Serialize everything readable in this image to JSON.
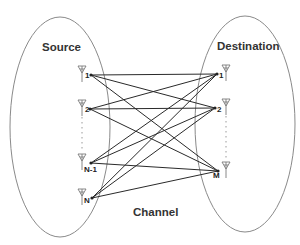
{
  "diagram": {
    "type": "mimo-channel",
    "labels": {
      "source": "Source",
      "destination": "Destination",
      "channel": "Channel"
    },
    "colors": {
      "ellipse_stroke": "#8a8a8a",
      "link_stroke": "#2a2a2a",
      "antenna_stroke": "#7a7a7a",
      "text": "#333333"
    },
    "source_nodes": [
      {
        "id": "s1",
        "label": "1",
        "x": 91,
        "y": 75
      },
      {
        "id": "s2",
        "label": "2",
        "x": 90,
        "y": 109
      },
      {
        "id": "sN1",
        "label": "N-1",
        "x": 91,
        "y": 163
      },
      {
        "id": "sN",
        "label": "N",
        "x": 92,
        "y": 198
      }
    ],
    "destination_nodes": [
      {
        "id": "d1",
        "label": "1",
        "x": 217,
        "y": 74
      },
      {
        "id": "d2",
        "label": "2",
        "x": 215,
        "y": 108
      },
      {
        "id": "dM",
        "label": "M",
        "x": 218,
        "y": 171
      }
    ],
    "links": "every source antenna connected to every destination antenna"
  }
}
